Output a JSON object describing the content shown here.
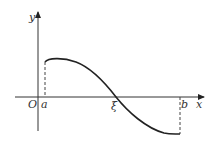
{
  "diagram": {
    "type": "function-graph",
    "labels": {
      "y_axis": "y",
      "x_axis": "x",
      "origin": "O",
      "a": "a",
      "b": "b",
      "xi": "ξ"
    },
    "colors": {
      "stroke": "#222222",
      "background": "#ffffff"
    }
  }
}
